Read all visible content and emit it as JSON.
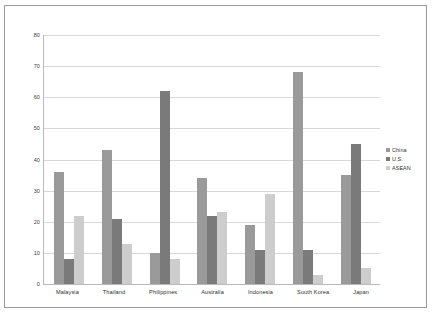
{
  "chart_data": {
    "type": "bar",
    "title": "",
    "subtitle": "",
    "xlabel": "",
    "ylabel": "",
    "ylim": [
      0,
      80
    ],
    "yticks": [
      0,
      10,
      20,
      30,
      40,
      50,
      60,
      70,
      80
    ],
    "ytick_labels": [
      "0",
      "10",
      "20",
      "30",
      "40",
      "50",
      "60",
      "70",
      "80"
    ],
    "grid": true,
    "legend_position": "right",
    "categories": [
      "Malaysia",
      "Thailand",
      "Philippines",
      "Australia",
      "Indonesia",
      "South Korea",
      "Japan"
    ],
    "series": [
      {
        "name": "China",
        "color": "#9a9a9a",
        "values": [
          36,
          43,
          10,
          34,
          19,
          68,
          35
        ]
      },
      {
        "name": "U.S.",
        "color": "#7a7a7a",
        "values": [
          8,
          21,
          62,
          22,
          11,
          11,
          45
        ]
      },
      {
        "name": "ASEAN",
        "color": "#cdcdcd",
        "values": [
          22,
          13,
          8,
          23,
          29,
          3,
          5
        ]
      }
    ]
  },
  "legend": {
    "items": [
      {
        "label": "China",
        "color": "#9a9a9a"
      },
      {
        "label": "U.S.",
        "color": "#7a7a7a"
      },
      {
        "label": "ASEAN",
        "color": "#cdcdcd"
      }
    ]
  },
  "colors": {
    "china": "#9a9a9a",
    "us": "#7a7a7a",
    "asean": "#cdcdcd",
    "grid": "#d8d8d8",
    "axis": "#b9b9b9",
    "frame": "#9a9a9a",
    "text": "#2e2e2e"
  }
}
